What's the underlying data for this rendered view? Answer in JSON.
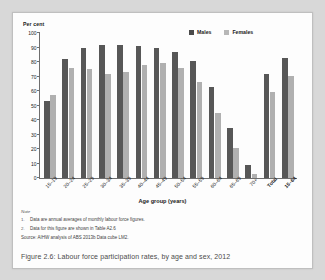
{
  "figure": {
    "caption": "Figure 2.6: Labour force participation rates, by age and sex, 2012",
    "notes_heading": "Note",
    "notes": [
      {
        "num": "1.",
        "text": "Data are annual averages of monthly labour force figures."
      },
      {
        "num": "2.",
        "text": "Data for this figure are shown in Table A2.6"
      }
    ],
    "source": "Source: AIHW analysis of ABS 2013b Data cube LM2."
  },
  "colors": {
    "males": "#575757",
    "females": "#b0b0b0",
    "axis": "#6e6e6e",
    "card_background": "#fdfdfd",
    "page_background": "#d8d8d8"
  },
  "chart_data": {
    "type": "bar",
    "title": "",
    "unit_label": "Per cent",
    "xlabel": "Age group (years)",
    "ylabel": "Per cent",
    "ylim": [
      0,
      100
    ],
    "yticks": [
      0,
      10,
      20,
      30,
      40,
      50,
      60,
      70,
      80,
      90,
      100
    ],
    "grid": false,
    "legend_position": "top-right",
    "categories": [
      "15–19",
      "20–24",
      "25–29",
      "30–34",
      "35–39",
      "40–44",
      "45–49",
      "50–54",
      "55–59",
      "60–64",
      "65–69",
      "70+",
      "Total",
      "15–64"
    ],
    "bold_categories": [
      "Total",
      "15–64"
    ],
    "series": [
      {
        "name": "Males",
        "color": "#575757",
        "values": [
          53,
          82,
          90,
          92,
          92,
          91,
          89.5,
          87,
          80.5,
          63,
          34.5,
          9,
          72,
          83
        ]
      },
      {
        "name": "Females",
        "color": "#b0b0b0",
        "values": [
          57,
          76,
          75,
          72,
          73,
          78,
          79,
          76,
          66,
          45,
          20.5,
          3,
          59,
          70.5
        ]
      }
    ]
  }
}
